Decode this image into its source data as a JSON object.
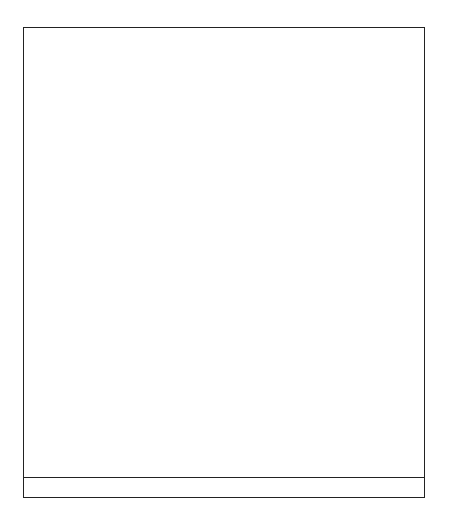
{
  "colors": {
    "dark": "#2b2b2b",
    "light": "#bdbdbd",
    "grid": "#999999"
  },
  "grid": {
    "columns": 24,
    "rows": 26
  },
  "row_labels": [
    {
      "row": 25,
      "label": "25"
    },
    {
      "row": 20,
      "label": "20"
    },
    {
      "row": 15,
      "label": "15"
    },
    {
      "row": 10,
      "label": "10"
    },
    {
      "row": 5,
      "label": "5"
    }
  ],
  "chart_data": {
    "type": "heatmap",
    "dark_cells_by_row": {
      "26": [
        3,
        7,
        11,
        15,
        19,
        23
      ],
      "25": [
        2,
        4,
        6,
        8,
        10,
        12,
        14,
        16,
        18,
        20,
        22,
        24
      ],
      "24": [
        1,
        5,
        9,
        13,
        17,
        21
      ],
      "23": "all",
      "22": [],
      "21": [
        1,
        3,
        5,
        7,
        9,
        11,
        13,
        15,
        17,
        19,
        21,
        23
      ],
      "20": "all",
      "19": [
        2,
        4,
        6,
        8,
        10,
        12,
        14,
        16,
        18,
        20,
        22,
        24
      ],
      "18": [],
      "17": "all",
      "16": [],
      "15": [
        3,
        4,
        5,
        11,
        12,
        13,
        19,
        20,
        21
      ],
      "14": [
        2,
        6,
        10,
        14,
        18,
        22
      ],
      "13": [
        1,
        3,
        5,
        7,
        9,
        11,
        13,
        15,
        17,
        19,
        21,
        23
      ],
      "12": [
        1,
        4,
        7,
        9,
        12,
        15,
        17,
        20,
        23
      ],
      "11": [
        1,
        3,
        5,
        7,
        9,
        11,
        13,
        15,
        17,
        19,
        21,
        23
      ],
      "10": [
        2,
        6,
        10,
        14,
        18,
        22
      ],
      "9": [
        3,
        4,
        5,
        11,
        12,
        13,
        19,
        20,
        21
      ],
      "8": [],
      "7": [
        2,
        4,
        6,
        8,
        10,
        12,
        14,
        16,
        18,
        20,
        22,
        24
      ],
      "6": [
        1,
        3,
        5,
        7,
        9,
        11,
        13,
        15,
        17,
        19,
        21,
        23
      ],
      "5": [
        6,
        12,
        18,
        24
      ],
      "4": [
        1,
        5,
        7,
        11,
        13,
        17,
        19,
        23
      ],
      "3": [
        2,
        4,
        8,
        10,
        14,
        16,
        20,
        22
      ],
      "2": [
        3,
        9,
        15,
        21
      ],
      "1": "all"
    },
    "ylabel_ticks": [
      5,
      10,
      15,
      20,
      25
    ]
  }
}
